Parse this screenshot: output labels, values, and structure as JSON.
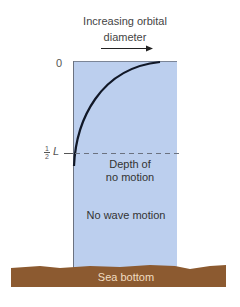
{
  "title": {
    "line1": "Increasing orbital",
    "line2": "diameter"
  },
  "axis": {
    "zero_label": "0",
    "half_num": "1",
    "half_den": "2",
    "half_var": "L"
  },
  "labels": {
    "depth_line1": "Depth of",
    "depth_line2": "no motion",
    "no_motion": "No wave motion",
    "sea_bottom": "Sea bottom"
  },
  "colors": {
    "water": "#bccfee",
    "seabed": "#8c5a30",
    "curve": "#111827",
    "dash": "#6b7280"
  }
}
